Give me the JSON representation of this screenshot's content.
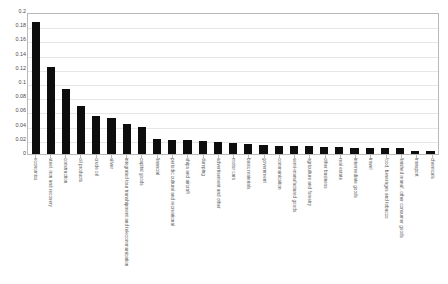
{
  "chart": {
    "title": "",
    "axis": {
      "y_ticks": [
        "0.2",
        "0.18",
        "0.16",
        "0.14",
        "0.12",
        "0.1",
        "0.08",
        "0.06",
        "0.04",
        "0.02",
        "0"
      ]
    }
  },
  "chart_data": {
    "type": "bar",
    "title": "",
    "xlabel": "",
    "ylabel": "",
    "ylim": [
      0,
      0.2
    ],
    "ytick_values": [
      0,
      0.02,
      0.04,
      0.06,
      0.08,
      0.1,
      0.12,
      0.14,
      0.16,
      0.18,
      0.2
    ],
    "grid": true,
    "legend": "none",
    "orientation": "vertical",
    "bar_color": "#0d0d0d",
    "categories": [
      "economics",
      "steel, iron and recovery",
      "construction",
      "oil products",
      "crude oil",
      "silver",
      "integrated tour transhipment and telecommunication",
      "capital goods",
      "financial",
      "periodic cultural and recreational",
      "ships and aircraft",
      "dumping",
      "advertisement and other",
      "motor cars",
      "basic materials",
      "government",
      "communication",
      "semi-manufactured goods",
      "agriculture and forestry",
      "other business",
      "real estate",
      "intermediate goods",
      "travel",
      "food, beverages and tobacco",
      "finished manuf. other consumer goods",
      "transport",
      "chemicals"
    ],
    "values": [
      0.188,
      0.124,
      0.093,
      0.068,
      0.055,
      0.051,
      0.043,
      0.038,
      0.021,
      0.02,
      0.02,
      0.019,
      0.017,
      0.016,
      0.015,
      0.013,
      0.012,
      0.011,
      0.011,
      0.01,
      0.01,
      0.009,
      0.009,
      0.008,
      0.008,
      0.005,
      0.005
    ]
  }
}
